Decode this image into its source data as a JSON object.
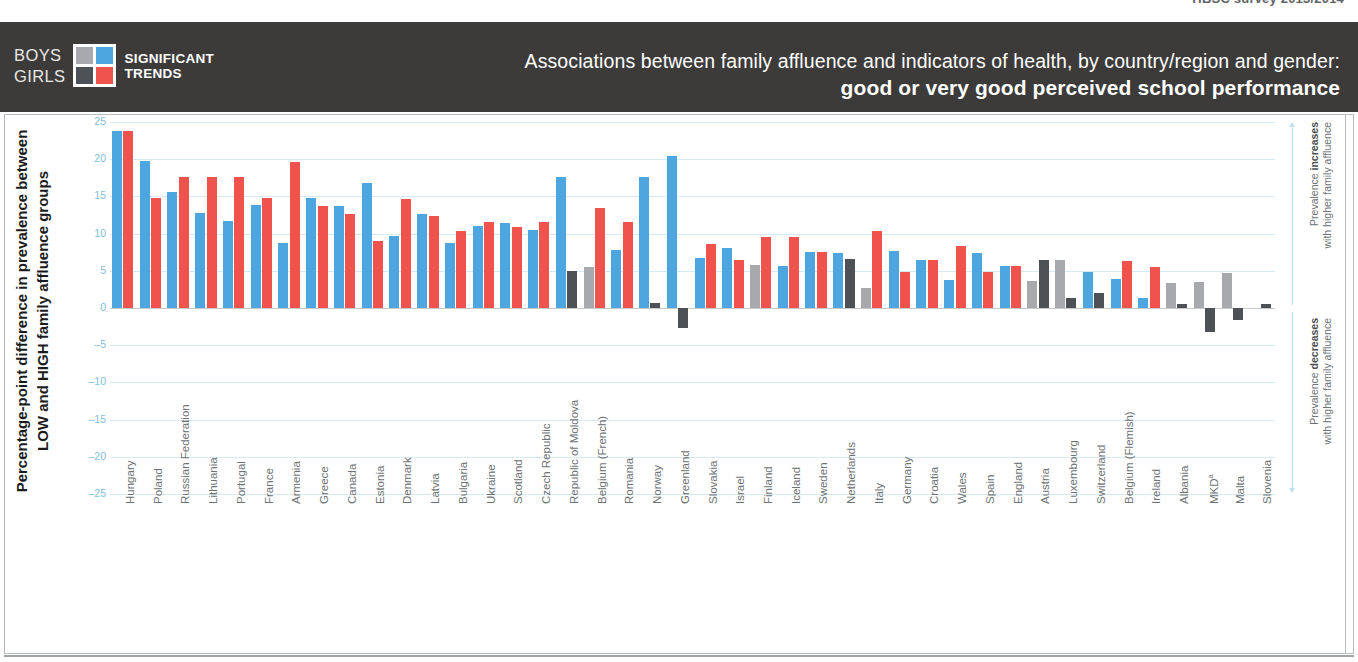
{
  "topstrip": {
    "cut_text": "HBSC survey 2013/2014"
  },
  "header": {
    "legend": {
      "boys_label": "BOYS",
      "girls_label": "GIRLS",
      "significant_line1": "SIGNIFICANT",
      "significant_line2": "TRENDS",
      "swatches": [
        {
          "name": "boys-non-significant",
          "color": "#a7a9ac"
        },
        {
          "name": "boys-significant",
          "color": "#4ea6e0"
        },
        {
          "name": "girls-non-significant",
          "color": "#4d5156"
        },
        {
          "name": "girls-significant",
          "color": "#f0534e"
        }
      ]
    },
    "title_line1": "Associations between family affluence and indicators of health, by country/region and gender:",
    "title_line2": "good or very good perceived school performance"
  },
  "annotations": {
    "increase_line1": "Prevalence ",
    "increase_bold": "increases",
    "increase_line2": "with higher family affluence",
    "decrease_line1": "Prevalence ",
    "decrease_bold": "decreases",
    "decrease_line2": "with higher family affluence"
  },
  "colors": {
    "boys_significant": "#4ea6e0",
    "boys_non_significant": "#a7a9ac",
    "girls_significant": "#f0534e",
    "girls_non_significant": "#4d5156",
    "gridline": "#d7eaf4",
    "zero_line": "#c8c9ca",
    "header_bg": "#3c3b3a",
    "tick_label": "#7fbfe0",
    "category_label": "#6d7275"
  },
  "chart_data": {
    "type": "bar",
    "title": "Associations between family affluence and indicators of health, by country/region and gender: good or very good perceived school performance",
    "xlabel": "",
    "ylabel": "Percentage-point difference in prevalence between LOW and HIGH family affluence groups",
    "ylim": [
      -25,
      25
    ],
    "yticks": [
      25,
      20,
      15,
      10,
      5,
      0,
      -5,
      -10,
      -15,
      -20,
      -25
    ],
    "grid": true,
    "legend_position": "top-left",
    "footnote": "a",
    "categories": [
      "Hungary",
      "Poland",
      "Russian Federation",
      "Lithuania",
      "Portugal",
      "France",
      "Armenia",
      "Greece",
      "Canada",
      "Estonia",
      "Denmark",
      "Latvia",
      "Bulgaria",
      "Ukraine",
      "Scotland",
      "Czech Republic",
      "Republic of Moldova",
      "Belgium (French)",
      "Romania",
      "Norway",
      "Greenland",
      "Slovakia",
      "Israel",
      "Finland",
      "Iceland",
      "Sweden",
      "Netherlands",
      "Italy",
      "Germany",
      "Croatia",
      "Wales",
      "Spain",
      "England",
      "Austria",
      "Luxembourg",
      "Switzerland",
      "Belgium (Flemish)",
      "Ireland",
      "Albania",
      "MKD",
      "Malta",
      "Slovenia"
    ],
    "series": [
      {
        "name": "Boys",
        "values": [
          23.8,
          19.8,
          15.6,
          12.8,
          11.7,
          13.8,
          8.8,
          14.8,
          13.7,
          16.8,
          9.7,
          12.6,
          8.8,
          11.0,
          11.4,
          10.5,
          17.6,
          5.5,
          7.8,
          17.6,
          20.4,
          6.7,
          8.1,
          5.8,
          5.7,
          7.5,
          7.4,
          2.7,
          7.7,
          6.4,
          3.8,
          7.4,
          5.6,
          3.6,
          6.4,
          4.8,
          3.9,
          1.3,
          3.3,
          3.5,
          4.7,
          0.0
        ],
        "significance": [
          true,
          true,
          true,
          true,
          true,
          true,
          true,
          true,
          true,
          true,
          true,
          true,
          true,
          true,
          true,
          true,
          true,
          false,
          true,
          true,
          true,
          true,
          true,
          false,
          true,
          true,
          true,
          false,
          true,
          true,
          true,
          true,
          true,
          false,
          false,
          true,
          true,
          true,
          false,
          false,
          false,
          false
        ]
      },
      {
        "name": "Girls",
        "values": [
          23.8,
          14.8,
          17.6,
          17.6,
          17.6,
          14.8,
          19.6,
          13.7,
          12.7,
          9.0,
          14.6,
          12.4,
          10.4,
          11.6,
          10.9,
          11.5,
          5.0,
          13.4,
          11.6,
          0.7,
          -2.7,
          8.6,
          6.5,
          9.6,
          9.6,
          7.5,
          6.6,
          10.3,
          4.9,
          6.5,
          8.4,
          4.8,
          5.7,
          6.5,
          1.4,
          2.0,
          6.3,
          5.5,
          0.5,
          -3.2,
          -1.6,
          0.6
        ],
        "significance": [
          true,
          true,
          true,
          true,
          true,
          true,
          true,
          true,
          true,
          true,
          true,
          true,
          true,
          true,
          true,
          true,
          false,
          true,
          true,
          false,
          false,
          true,
          true,
          true,
          true,
          true,
          false,
          true,
          true,
          true,
          true,
          true,
          true,
          false,
          false,
          false,
          true,
          true,
          false,
          false,
          false,
          false
        ]
      }
    ]
  }
}
